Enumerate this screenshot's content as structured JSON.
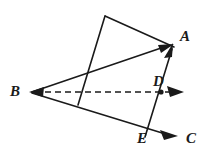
{
  "figure": {
    "kind": "geometry-diagram",
    "canvas": {
      "width": 211,
      "height": 162
    },
    "colors": {
      "background": "#ffffff",
      "stroke": "#1a1a1a",
      "label": "#1a1a1a",
      "dashed_stroke": "#1a1a1a"
    },
    "stroke_width": 1.6,
    "dash_pattern": "6,4"
  },
  "points": {
    "A": {
      "label": "A",
      "x": 171,
      "y": 44,
      "label_x": 180,
      "label_y": 29,
      "marked": false
    },
    "B": {
      "label": "B",
      "x": 31,
      "y": 92,
      "label_x": 10,
      "label_y": 84,
      "marked": false
    },
    "C": {
      "label": "C",
      "x": 176,
      "y": 135,
      "label_x": 186,
      "label_y": 131,
      "marked": false
    },
    "D": {
      "label": "D",
      "x": 161,
      "y": 92,
      "label_x": 154,
      "label_y": 74,
      "marked": true
    },
    "E": {
      "label": "E",
      "x": 145,
      "y": 137,
      "label_x": 138,
      "label_y": 131,
      "marked": false
    },
    "P": {
      "label": "",
      "x": 105,
      "y": 16,
      "label_x": 0,
      "label_y": 0,
      "marked": false
    },
    "Q": {
      "label": "",
      "x": 78,
      "y": 105,
      "label_x": 0,
      "label_y": 0,
      "marked": false
    }
  },
  "segments": [
    {
      "name": "ray-b-to-a",
      "from": "B",
      "to": "A",
      "style": "solid",
      "arrow_end": true
    },
    {
      "name": "ray-b-through-e-to-c",
      "from": "B",
      "to": "C",
      "style": "solid",
      "arrow_end": true
    },
    {
      "name": "segment-e-to-a",
      "from": "E",
      "to": "A",
      "style": "solid",
      "arrow_end": true
    },
    {
      "name": "quad-edge-top-left",
      "from": "Q",
      "to": "P",
      "style": "solid",
      "arrow_end": false
    },
    {
      "name": "quad-edge-top-right",
      "from": "P",
      "to": "A",
      "style": "solid",
      "arrow_end": false
    },
    {
      "name": "dashed-ray-b-through-d",
      "from": "B",
      "to": "right-edge",
      "style": "dashed",
      "arrow_end": true
    }
  ],
  "dashed_ray": {
    "name": "dashed-ray-bd",
    "x1": 33,
    "y1": 92,
    "x2": 170,
    "y2": 92,
    "arrow_tip_x": 182,
    "arrow_tip_y": 92
  },
  "arrow_heads": [
    {
      "name": "arrowhead-at-a-from-b",
      "tip_x": 171,
      "tip_y": 44,
      "angle_deg": -19
    },
    {
      "name": "arrowhead-at-a-from-e",
      "tip_x": 172,
      "tip_y": 46,
      "angle_deg": -64
    },
    {
      "name": "arrowhead-at-c",
      "tip_x": 177,
      "tip_y": 135,
      "angle_deg": 19
    },
    {
      "name": "arrowhead-at-dashed-end",
      "tip_x": 183,
      "tip_y": 92,
      "angle_deg": 0
    },
    {
      "name": "arrowhead-at-b",
      "tip_x": 31,
      "tip_y": 92,
      "angle_deg": 180
    }
  ],
  "labels": [
    "A",
    "B",
    "C",
    "D",
    "E"
  ]
}
